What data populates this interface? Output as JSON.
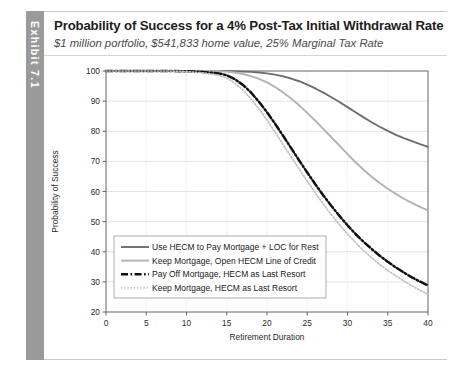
{
  "exhibit": {
    "tab_label": "Exhibit 7.1"
  },
  "header": {
    "title": "Probability of Success for a 4% Post-Tax Initial Withdrawal Rate",
    "subtitle": "$1 million portfolio, $541,833 home value, 25% Marginal Tax Rate"
  },
  "colors": {
    "series_1": "#6e6e6e",
    "series_2": "#b3b3b3",
    "series_3": "#111111",
    "series_4": "#c2c2c2",
    "grid": "#d9d9d9",
    "axis": "#555555",
    "tab_bg": "#9a9a9a"
  },
  "chart_data": {
    "type": "line",
    "title": "Probability of Success for a 4% Post-Tax Initial Withdrawal Rate",
    "subtitle": "$1 million portfolio, $541,833 home value, 25% Marginal Tax Rate",
    "xlabel": "Retirement Duration",
    "ylabel": "Probability of Success",
    "xlim": [
      0,
      40
    ],
    "ylim": [
      20,
      100
    ],
    "xticks": [
      0,
      5,
      10,
      15,
      20,
      25,
      30,
      35,
      40
    ],
    "yticks": [
      20,
      30,
      40,
      50,
      60,
      70,
      80,
      90,
      100
    ],
    "grid": true,
    "legend_position": "lower-left",
    "x": [
      0,
      2,
      4,
      6,
      8,
      10,
      12,
      14,
      15,
      16,
      17,
      18,
      19,
      20,
      21,
      22,
      23,
      24,
      25,
      26,
      27,
      28,
      29,
      30,
      31,
      32,
      33,
      34,
      35,
      36,
      37,
      38,
      39,
      40
    ],
    "series": [
      {
        "name": "Use HECM to Pay Mortgage + LOC for Rest",
        "style": "solid",
        "color": "#6e6e6e",
        "values": [
          100,
          100,
          100,
          100,
          100,
          100,
          100,
          100,
          100,
          99.9,
          99.8,
          99.7,
          99.5,
          99.2,
          98.8,
          98.2,
          97.5,
          96.6,
          95.5,
          94.2,
          92.8,
          91.3,
          89.7,
          88.0,
          86.3,
          84.6,
          83.0,
          81.5,
          80.1,
          78.8,
          77.7,
          76.7,
          75.7,
          74.8
        ]
      },
      {
        "name": "Keep Mortgage, Open HECM Line of Credit",
        "style": "solid",
        "color": "#b3b3b3",
        "values": [
          100,
          100,
          100,
          100,
          100,
          100,
          100,
          99.9,
          99.8,
          99.5,
          99.0,
          98.3,
          97.4,
          96.2,
          94.7,
          92.9,
          90.9,
          88.6,
          86.1,
          83.5,
          80.8,
          78.0,
          75.2,
          72.4,
          69.7,
          67.2,
          64.9,
          62.8,
          60.9,
          59.2,
          57.6,
          56.2,
          54.9,
          53.7
        ]
      },
      {
        "name": "Pay Off Mortgage, HECM as Last Resort",
        "style": "dashdot",
        "color": "#111111",
        "values": [
          100,
          100,
          100,
          100,
          100,
          99.9,
          99.7,
          99.2,
          98.6,
          97.3,
          95.4,
          92.9,
          89.8,
          86.3,
          82.5,
          78.5,
          74.4,
          70.3,
          66.3,
          62.4,
          58.7,
          55.2,
          51.9,
          48.8,
          45.9,
          43.3,
          40.9,
          38.7,
          36.7,
          34.8,
          33.1,
          31.5,
          30.1,
          28.8
        ]
      },
      {
        "name": "Keep Mortgage, HECM as Last Resort",
        "style": "dotted",
        "color": "#c2c2c2",
        "values": [
          100,
          100,
          100,
          100,
          100,
          99.8,
          99.4,
          98.6,
          97.7,
          96.0,
          93.7,
          90.8,
          87.4,
          83.7,
          79.7,
          75.6,
          71.5,
          67.4,
          63.4,
          59.5,
          55.8,
          52.3,
          49.0,
          45.9,
          43.0,
          40.4,
          38.0,
          35.8,
          33.8,
          32.0,
          30.3,
          28.7,
          27.2,
          25.9
        ]
      }
    ]
  }
}
